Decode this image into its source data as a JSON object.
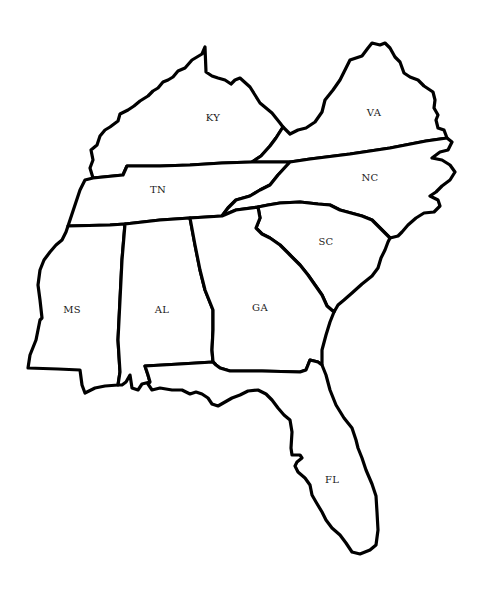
{
  "map": {
    "title": "",
    "background": "#ffffff",
    "outline_color": "#000000",
    "label_color": "#1a1a1a",
    "states": [
      {
        "id": "KY",
        "label": "KY",
        "label_pos": [
          213,
          118
        ],
        "path": "M90,168 L93,160 L91,150 L97,145 L100,136 L105,130 L110,127 L118,121 L120,114 L128,110 L134,106 L140,101 L148,96 L153,91 L158,88 L163,82 L168,80 L173,77 L178,71 L185,68 L192,60 L202,54 L205,47 L206,72 L212,76 L218,78 L225,80 L231,84 L235,80 L240,78 L250,87 L255,95 L260,103 L266,108 L272,113 L280,123 L283,127 L276,138 L270,146 L261,156 L252,162 L222,163 L190,165 L160,166 L127,166 L123,175 L93,178 Z"
      },
      {
        "id": "VA",
        "label": "VA",
        "label_pos": [
          374,
          113
        ],
        "path": "M283,127 L290,134 L298,130 L306,128 L315,122 L322,112 L325,100 L333,90 L340,80 L345,70 L350,60 L362,56 L368,48 L372,43 L380,45 L385,43 L390,48 L395,57 L400,62 L404,73 L410,77 L418,80 L424,86 L433,92 L435,100 L434,108 L438,115 L436,120 L438,128 L444,130 L447,138 L426,141 L390,148 L350,154 L310,159 L290,162 L252,162 L261,156 L270,146 L276,138 Z"
      },
      {
        "id": "TN",
        "label": "TN",
        "label_pos": [
          158,
          190
        ],
        "path": "M93,178 L123,175 L127,166 L160,166 L190,165 L222,163 L252,162 L290,162 L278,175 L270,185 L260,190 L250,196 L236,200 L228,208 L222,216 L190,218 L160,220 L125,224 L110,225 L68,226 L75,205 L80,190 L85,180 Z"
      },
      {
        "id": "NC",
        "label": "NC",
        "label_pos": [
          370,
          178
        ],
        "path": "M290,162 L310,159 L350,154 L390,148 L426,141 L447,138 L452,142 L448,150 L440,152 L432,158 L442,160 L450,165 L455,172 L450,180 L442,186 L436,192 L430,196 L438,200 L440,206 L434,212 L424,213 L416,218 L408,225 L402,232 L398,236 L390,238 L372,220 L362,216 L340,210 L330,205 L318,204 L300,202 L280,203 L268,205 L258,207 L236,210 L222,216 L228,208 L236,200 L250,196 L260,190 L270,185 L278,175 Z"
      },
      {
        "id": "SC",
        "label": "SC",
        "label_pos": [
          326,
          242
        ],
        "path": "M258,207 L268,205 L280,203 L300,202 L318,204 L330,205 L340,210 L362,216 L372,220 L390,238 L388,242 L385,250 L381,258 L378,268 L372,276 L362,284 L352,293 L344,300 L338,305 L334,312 L327,306 L322,295 L315,285 L308,275 L300,265 L290,255 L280,245 L270,238 L262,234 L256,228 L260,218 Z"
      },
      {
        "id": "MS",
        "label": "MS",
        "label_pos": [
          72,
          310
        ],
        "path": "M68,226 L110,225 L125,224 L122,260 L120,300 L118,340 L120,372 L118,385 L105,386 L95,388 L85,393 L82,385 L80,370 L58,369 L28,368 L30,355 L36,340 L40,320 L42,318 L40,300 L38,285 L40,270 L44,260 L50,252 L56,245 L62,240 L66,232 Z"
      },
      {
        "id": "AL",
        "label": "AL",
        "label_pos": [
          162,
          310
        ],
        "path": "M125,224 L160,220 L190,218 L195,245 L200,270 L205,290 L213,310 L213,330 L212,350 L213,362 L180,364 L145,366 L148,375 L150,382 L142,384 L138,390 L132,388 L130,375 L126,382 L122,385 L118,385 L120,372 L118,340 L120,300 L122,260 Z"
      },
      {
        "id": "GA",
        "label": "GA",
        "label_pos": [
          260,
          308
        ],
        "path": "M190,218 L222,216 L236,210 L258,207 L260,218 L256,228 L262,234 L270,238 L280,245 L290,255 L300,265 L308,275 L315,285 L322,295 L327,306 L334,312 L330,322 L326,335 L322,350 L322,365 L318,362 L310,360 L306,370 L300,372 L262,371 L230,371 L220,368 L216,365 L213,362 L212,350 L213,330 L213,310 L205,290 L200,270 L195,245 Z"
      },
      {
        "id": "FL",
        "label": "FL",
        "label_pos": [
          332,
          480
        ],
        "path": "M145,366 L180,364 L213,362 L216,365 L220,368 L230,371 L262,371 L300,372 L306,370 L310,360 L318,362 L322,365 L326,375 L330,390 L336,405 L344,418 L352,428 L356,440 L358,448 L362,458 L366,470 L372,484 L376,496 L377,512 L378,530 L376,545 L370,550 L360,554 L352,552 L346,543 L340,535 L332,528 L326,520 L322,512 L316,502 L312,495 L310,485 L305,478 L298,472 L295,466 L297,462 L302,458 L300,455 L292,455 L291,448 L292,432 L290,420 L284,415 L278,408 L272,400 L266,394 L258,390 L248,391 L240,395 L232,398 L225,402 L218,406 L212,404 L208,398 L202,394 L196,392 L190,394 L182,390 L172,390 L160,388 L152,390 L148,384 L150,382 L148,375 Z"
      }
    ]
  }
}
